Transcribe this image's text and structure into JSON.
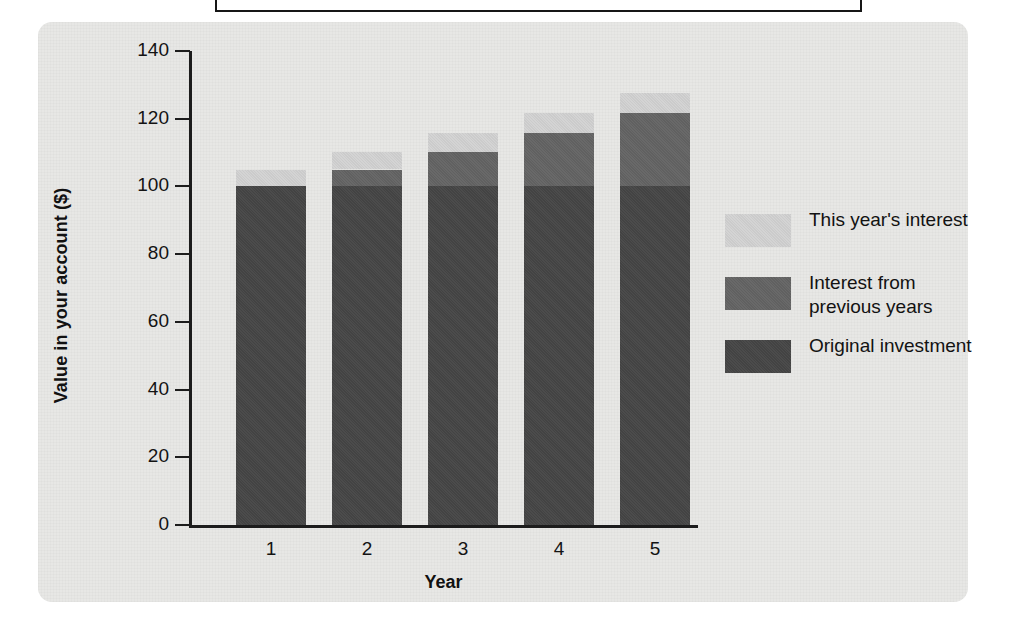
{
  "chart_data": {
    "type": "bar",
    "stacked": true,
    "title": "",
    "xlabel": "Year",
    "ylabel": "Value in your account ($)",
    "categories": [
      "1",
      "2",
      "3",
      "4",
      "5"
    ],
    "ylim": [
      0,
      140
    ],
    "yticks": [
      0,
      20,
      40,
      60,
      80,
      100,
      120,
      140
    ],
    "ytick_labels": [
      "0",
      "20",
      "40",
      "60",
      "80",
      "100",
      "120",
      "140"
    ],
    "grid": false,
    "legend_position": "right",
    "series": [
      {
        "name": "Original investment",
        "color": "#454545",
        "values": [
          100,
          100,
          100,
          100,
          100
        ]
      },
      {
        "name": "Interest from previous years",
        "color": "#646464",
        "values": [
          0,
          5,
          10.25,
          15.76,
          21.55
        ]
      },
      {
        "name": "This year's interest",
        "color": "#d2d2d2",
        "values": [
          5,
          5.25,
          5.51,
          5.79,
          6.08
        ]
      }
    ],
    "totals": [
      105,
      110.25,
      115.76,
      121.55,
      127.63
    ]
  },
  "axes": {
    "y_title": "Value in your account ($)",
    "x_title": "Year",
    "y_ticks": [
      {
        "label": "140",
        "value": 140
      },
      {
        "label": "120",
        "value": 120
      },
      {
        "label": "100",
        "value": 100
      },
      {
        "label": "80",
        "value": 80
      },
      {
        "label": "60",
        "value": 60
      },
      {
        "label": "40",
        "value": 40
      },
      {
        "label": "20",
        "value": 20
      },
      {
        "label": "0",
        "value": 0
      }
    ],
    "x_ticks": [
      "1",
      "2",
      "3",
      "4",
      "5"
    ]
  },
  "legend": {
    "items": [
      {
        "label": "This year's interest",
        "color": "#d2d2d2",
        "key": "thisyear"
      },
      {
        "label": "Interest from previous years",
        "color": "#646464",
        "key": "previous"
      },
      {
        "label": "Original investment",
        "color": "#454545",
        "key": "original"
      }
    ]
  },
  "colors": {
    "panel_background": "#e7e7e5",
    "page_background": "#ffffff",
    "axis": "#1c1c1c",
    "text": "#121212",
    "original_investment": "#454545",
    "interest_previous": "#646464",
    "interest_this_year": "#d2d2d2"
  }
}
